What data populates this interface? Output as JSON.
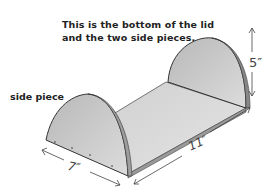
{
  "caption": {
    "line1": "This is the bottom of the lid",
    "line2": "and the two side pieces."
  },
  "labels": {
    "side_piece": "side piece"
  },
  "dimensions": {
    "height": "5″",
    "width": "7″",
    "length": "11″"
  },
  "colors": {
    "piece_fill": "#c9c9c9",
    "base_fill": "#d6d6d6",
    "outline": "#333333",
    "text": "#222222"
  }
}
